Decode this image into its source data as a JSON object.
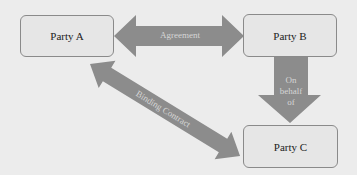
{
  "diagram": {
    "nodes": [
      {
        "id": "party-a",
        "label": "Party A"
      },
      {
        "id": "party-b",
        "label": "Party B"
      },
      {
        "id": "party-c",
        "label": "Party C"
      }
    ],
    "edges": [
      {
        "from": "party-a",
        "to": "party-b",
        "label": "Agreement",
        "direction": "both"
      },
      {
        "from": "party-b",
        "to": "party-c",
        "label": "On behalf of",
        "direction": "down"
      },
      {
        "from": "party-a",
        "to": "party-c",
        "label": "Binding Contract",
        "direction": "both"
      }
    ],
    "colors": {
      "arrow": "#8c8c8c",
      "box_fill": "#e6e6e6",
      "box_border": "#8a8a8a",
      "background": "#ececec"
    }
  }
}
